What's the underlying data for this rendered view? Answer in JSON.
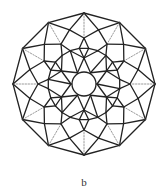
{
  "figure": {
    "label": "b",
    "center": [
      84,
      84
    ],
    "stroke_color": "#222222",
    "dashed_color": "#555555",
    "outer_polygon": {
      "sides": 12,
      "radius": 71,
      "rotation_deg": -90
    },
    "rings": [
      {
        "name": "outer",
        "count": 12,
        "radius": 71,
        "rotation_deg": -90
      },
      {
        "name": "second",
        "count": 12,
        "radius": 56,
        "rotation_deg": -75
      },
      {
        "name": "third",
        "count": 12,
        "radius": 46,
        "rotation_deg": -90
      },
      {
        "name": "square-ring",
        "count": 24,
        "radius": 36,
        "rotation_deg": -82.5
      },
      {
        "name": "inner-star-tips",
        "count": 6,
        "radius": 26,
        "rotation_deg": -90
      },
      {
        "name": "inner-star-valleys",
        "count": 6,
        "radius": 13,
        "rotation_deg": -60
      }
    ],
    "center_circle_radius": 12
  }
}
